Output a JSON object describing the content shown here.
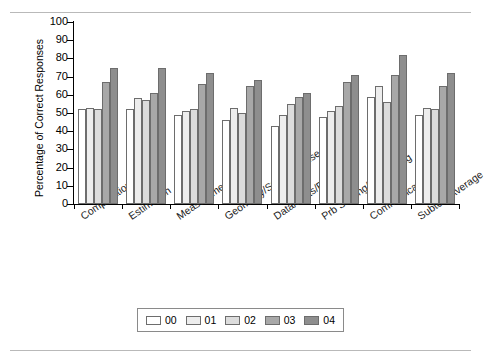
{
  "chart_data": {
    "type": "bar",
    "title": "",
    "xlabel": "",
    "ylabel": "Percentage of Correct Responses",
    "ylim": [
      0,
      100
    ],
    "ytick_step": 10,
    "yticks": [
      100,
      90,
      80,
      70,
      60,
      50,
      40,
      30,
      20,
      10,
      0
    ],
    "grid": false,
    "legend_position": "bottom",
    "categories": [
      "Computation",
      "Estimation",
      "Measurement",
      "Geometry/Spatial Sense",
      "Data/Stats/Probability",
      "Prb Solving/Reasoning",
      "Communication",
      "Subtest Average"
    ],
    "series": [
      {
        "name": "00",
        "color": "#ffffff",
        "values": [
          52,
          52,
          49,
          46,
          43,
          48,
          59,
          49
        ]
      },
      {
        "name": "01",
        "color": "#ededed",
        "values": [
          53,
          58,
          51,
          53,
          49,
          51,
          65,
          53
        ]
      },
      {
        "name": "02",
        "color": "#dcdcdc",
        "values": [
          52,
          57,
          52,
          50,
          55,
          54,
          56,
          52
        ]
      },
      {
        "name": "03",
        "color": "#a8a8a8",
        "values": [
          67,
          61,
          66,
          65,
          59,
          67,
          71,
          65
        ]
      },
      {
        "name": "04",
        "color": "#8e8e8e",
        "values": [
          75,
          75,
          72,
          68,
          61,
          71,
          82,
          72
        ]
      }
    ]
  },
  "legend": {
    "items": [
      {
        "label": "00"
      },
      {
        "label": "01"
      },
      {
        "label": "02"
      },
      {
        "label": "03"
      },
      {
        "label": "04"
      }
    ]
  },
  "colors": {
    "series_00": "#ffffff",
    "series_01": "#ededed",
    "series_02": "#dcdcdc",
    "series_03": "#a8a8a8",
    "series_04": "#8e8e8e",
    "bar_outline": "#6d6d6d",
    "axis": "#000000",
    "rule": "#b9b9b9"
  }
}
